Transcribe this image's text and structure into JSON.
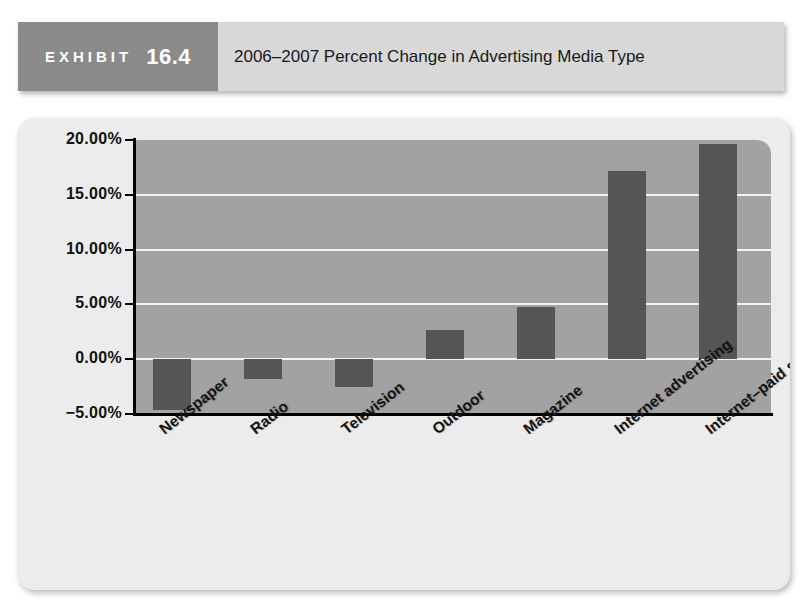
{
  "exhibit": {
    "word": "EXHIBIT",
    "number": "16.4",
    "title": "2006–2007 Percent Change in Advertising Media Type"
  },
  "chart_data": {
    "type": "bar",
    "title": "2006–2007 Percent Change in Advertising Media Type",
    "xlabel": "",
    "ylabel": "",
    "categories": [
      "Newspaper",
      "Radio",
      "Television",
      "Outdoor",
      "Magazine",
      "Internet advertising",
      "Internet–paid search"
    ],
    "values": [
      -4.6,
      -1.8,
      -2.5,
      2.7,
      4.8,
      17.2,
      19.6
    ],
    "value_labels": [
      "-4.60%",
      "-1.80%",
      "-2.50%",
      "2.70%",
      "4.80%",
      "17.20%",
      "19.60%"
    ],
    "ylim": [
      -5.0,
      20.0
    ],
    "ytick_values": [
      20.0,
      15.0,
      10.0,
      5.0,
      0.0,
      -5.0
    ],
    "ytick_labels": [
      "20.00%",
      "15.00%",
      "10.00%",
      "5.00%",
      "0.00%",
      "−5.00%"
    ],
    "grid": true,
    "legend": "none",
    "bar_color": "#555555",
    "plot_background": "#a2a2a2",
    "gridline_color": "#f2f2f2",
    "panel_background": "#ececec"
  }
}
